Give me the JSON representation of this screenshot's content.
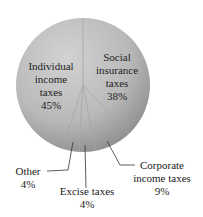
{
  "chart_data": {
    "type": "pie",
    "title": "",
    "categories": [
      "Social insurance taxes",
      "Corporate income taxes",
      "Excise taxes",
      "Other",
      "Individual income taxes"
    ],
    "values": [
      38,
      9,
      4,
      4,
      45
    ],
    "unit": "%",
    "start_angle_deg": 0,
    "direction": "clockwise",
    "labels": [
      {
        "lines": [
          "Social",
          "insurance",
          "taxes",
          "38%"
        ],
        "placement": "inside"
      },
      {
        "lines": [
          "Corporate",
          "income taxes",
          "9%"
        ],
        "placement": "outside-leader"
      },
      {
        "lines": [
          "Excise taxes",
          "4%"
        ],
        "placement": "outside-leader"
      },
      {
        "lines": [
          "Other",
          "4%"
        ],
        "placement": "outside-leader"
      },
      {
        "lines": [
          "Individual",
          "income",
          "taxes",
          "45%"
        ],
        "placement": "inside"
      }
    ],
    "legend": "none",
    "colors": {
      "fill_light": "#cfcfcf",
      "fill_dark": "#858585",
      "slice_edge": "#a9a9a9",
      "leader_line": "#333333"
    }
  }
}
